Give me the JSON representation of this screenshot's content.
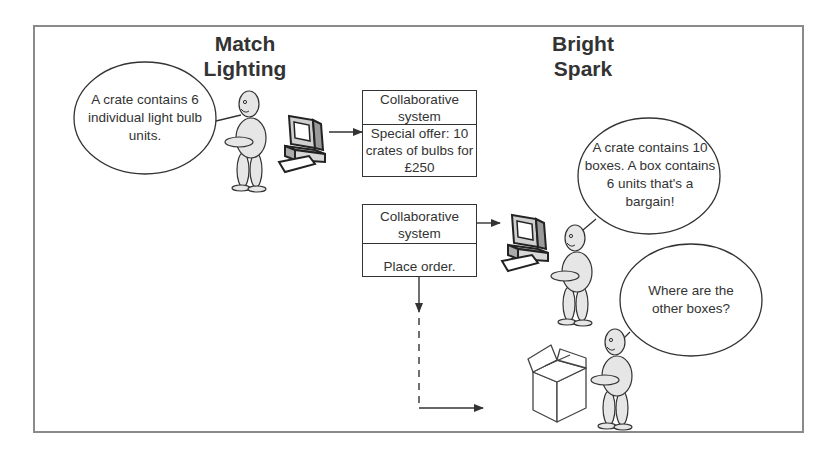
{
  "actors": {
    "left_company": {
      "name_line1": "Match",
      "name_line2": "Lighting"
    },
    "right_company": {
      "name_line1": "Bright",
      "name_line2": "Spark"
    }
  },
  "speech_bubbles": [
    {
      "speaker": "match-lighting-person",
      "text": "A crate contains 6 individual light bulb units."
    },
    {
      "speaker": "bright-spark-person-at-computer",
      "text": "A crate contains 10 boxes. A box contains 6 units that's a bargain!"
    },
    {
      "speaker": "bright-spark-person-with-box",
      "text": "Where are the other boxes?"
    }
  ],
  "system_boxes": [
    {
      "header": "Collaborative system",
      "body": "Special offer: 10 crates of bulbs for £250"
    },
    {
      "header": "Collaborative system",
      "body": "Place order."
    }
  ],
  "icons": [
    "person-icon",
    "computer-icon",
    "cardboard-box-icon",
    "arrow-icon"
  ],
  "colors": {
    "line": "#333333",
    "frame": "#8a8a8a",
    "figure_fill": "#e6e6e6",
    "background": "#ffffff"
  }
}
